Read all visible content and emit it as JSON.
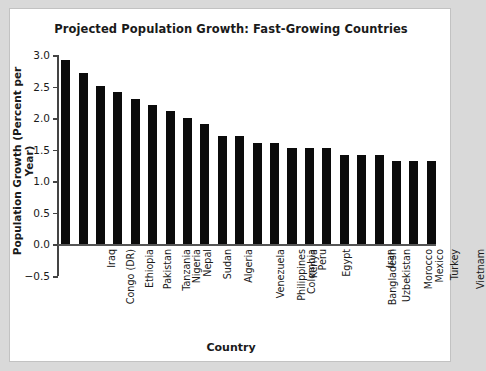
{
  "chart_data": {
    "type": "bar",
    "title": "Projected Population Growth: Fast-Growing Countries",
    "xlabel": "Country",
    "ylabel": "Population Growth (Percent per Year)",
    "categories": [
      "Congo (DR)",
      "Iraq",
      "Ethiopia",
      "Pakistan",
      "Tanzania",
      "Nigeria",
      "Nepal",
      "Sudan",
      "Algeria",
      "Venezuela",
      "Philippines",
      "Colombia",
      "Kenya",
      "Peru",
      "Egypt",
      "Bangladesh",
      "Uzbekistan",
      "Iran",
      "Morocco",
      "Mexico",
      "Turkey",
      "Vietnam"
    ],
    "values": [
      2.92,
      2.72,
      2.51,
      2.41,
      2.31,
      2.21,
      2.11,
      2.01,
      1.91,
      1.72,
      1.72,
      1.61,
      1.61,
      1.52,
      1.52,
      1.52,
      1.42,
      1.42,
      1.42,
      1.32,
      1.32,
      1.32
    ],
    "ylim": [
      -0.5,
      3.0
    ],
    "yticks": [
      -0.5,
      0.0,
      0.5,
      1.0,
      1.5,
      2.0,
      2.5,
      3.0
    ],
    "ytick_labels": [
      "−0.5",
      "0.0",
      "0.5",
      "1.0",
      "1.5",
      "2.0",
      "2.5",
      "3.0"
    ],
    "grid": false,
    "legend": false,
    "bar_color": "#0b0b0b",
    "axis_color": "#444444",
    "panel_color": "#ffffff",
    "background_color": "#d9d9d9"
  }
}
